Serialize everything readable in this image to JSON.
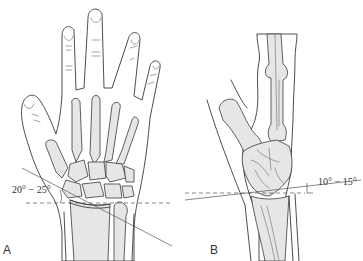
{
  "figure": {
    "panels": [
      {
        "id": "A",
        "letter": "A",
        "view": "dorsal view of hand and wrist",
        "angle_label": "20° − 25°",
        "angle_min_deg": 20,
        "angle_max_deg": 25
      },
      {
        "id": "B",
        "letter": "B",
        "view": "lateral view of hand and wrist",
        "angle_label": "10° − 15°",
        "angle_min_deg": 10,
        "angle_max_deg": 15
      }
    ],
    "colors": {
      "line": "#3a3a3a",
      "bone_fill": "#e6e6e6",
      "background": "#ffffff"
    }
  }
}
